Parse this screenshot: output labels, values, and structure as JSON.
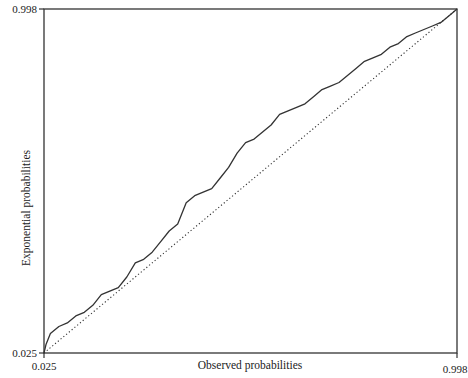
{
  "chart_data": {
    "type": "line",
    "title": "",
    "xlabel": "Observed probabilities",
    "ylabel": "Exponential probabilities",
    "xlim": [
      0.025,
      0.998
    ],
    "ylim": [
      0.025,
      0.998
    ],
    "x_ticks": [
      "0.025",
      "0.998"
    ],
    "y_ticks": [
      "0.025",
      "0.998"
    ],
    "grid": false,
    "legend": null,
    "series": [
      {
        "name": "P-P plot (observed vs exponential)",
        "style": "solid",
        "x": [
          0.025,
          0.03,
          0.04,
          0.06,
          0.08,
          0.1,
          0.12,
          0.14,
          0.16,
          0.18,
          0.2,
          0.22,
          0.24,
          0.26,
          0.28,
          0.3,
          0.32,
          0.34,
          0.36,
          0.38,
          0.4,
          0.42,
          0.44,
          0.46,
          0.48,
          0.5,
          0.52,
          0.54,
          0.56,
          0.58,
          0.6,
          0.62,
          0.64,
          0.66,
          0.68,
          0.7,
          0.72,
          0.74,
          0.76,
          0.78,
          0.8,
          0.82,
          0.84,
          0.86,
          0.88,
          0.9,
          0.92,
          0.94,
          0.96,
          0.98,
          0.998
        ],
        "y": [
          0.025,
          0.05,
          0.08,
          0.1,
          0.11,
          0.13,
          0.14,
          0.16,
          0.19,
          0.2,
          0.21,
          0.24,
          0.28,
          0.29,
          0.31,
          0.34,
          0.37,
          0.39,
          0.45,
          0.47,
          0.48,
          0.49,
          0.52,
          0.55,
          0.59,
          0.62,
          0.63,
          0.65,
          0.67,
          0.7,
          0.71,
          0.72,
          0.73,
          0.75,
          0.77,
          0.78,
          0.79,
          0.81,
          0.83,
          0.85,
          0.86,
          0.87,
          0.89,
          0.9,
          0.92,
          0.93,
          0.94,
          0.95,
          0.96,
          0.98,
          0.998
        ]
      },
      {
        "name": "Reference line (y = x)",
        "style": "dotted",
        "x": [
          0.025,
          0.998
        ],
        "y": [
          0.025,
          0.998
        ]
      }
    ]
  }
}
